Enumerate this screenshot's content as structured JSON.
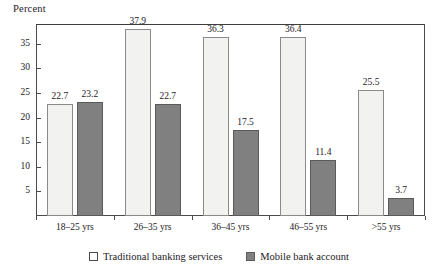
{
  "chart_data": {
    "type": "bar",
    "title": "",
    "xlabel": "",
    "ylabel": "Percent",
    "ylim": [
      0,
      39
    ],
    "yticks": [
      5,
      10,
      15,
      20,
      25,
      30,
      35
    ],
    "grid": false,
    "legend_position": "bottom-center",
    "categories": [
      "18–25 yrs",
      "26–35 yrs",
      "36–45 yrs",
      "46–55 yrs",
      ">55 yrs"
    ],
    "series": [
      {
        "name": "Traditional banking services",
        "color": "#f2f2f0",
        "values": [
          22.7,
          37.9,
          36.3,
          36.4,
          25.5
        ],
        "labels": [
          "22.7",
          "37.9",
          "36.3",
          "36.4",
          "25.5"
        ]
      },
      {
        "name": "Mobile bank account",
        "color": "#808080",
        "values": [
          23.2,
          22.7,
          17.5,
          11.4,
          3.7
        ],
        "labels": [
          "23.2",
          "22.7",
          "17.5",
          "11.4",
          "3.7"
        ]
      }
    ]
  },
  "axis": {
    "y_title": "Percent",
    "y_tick_labels": [
      "35",
      "30",
      "25",
      "20",
      "15",
      "10",
      "5"
    ]
  },
  "legend": {
    "items": [
      {
        "label": "Traditional banking services",
        "swatch": "light-square-swatch"
      },
      {
        "label": "Mobile bank account",
        "swatch": "dark-square-swatch"
      }
    ]
  }
}
